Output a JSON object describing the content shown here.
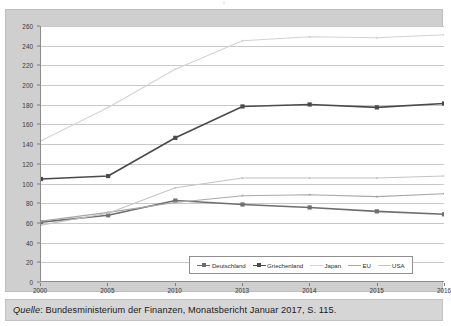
{
  "caption": {
    "source_label": "Quelle",
    "source_text": ": Bundesministerium der Finanzen, Monatsbericht Januar 2017, S. 115."
  },
  "chart_data": {
    "type": "line",
    "title": "",
    "xlabel": "",
    "ylabel": "Staatsschuldenquoten in %",
    "categories": [
      "2000",
      "2005",
      "2010",
      "2013",
      "2014",
      "2015",
      "2016"
    ],
    "ylim": [
      0,
      260
    ],
    "ytick_step": 20,
    "yticks": [
      0,
      20,
      40,
      60,
      80,
      100,
      120,
      140,
      160,
      180,
      200,
      220,
      240,
      260
    ],
    "grid": true,
    "legend_position": "bottom-center",
    "series": [
      {
        "name": "Deutschland",
        "color": "#6e6e6e",
        "marker": "square",
        "values": [
          60,
          67,
          82,
          78,
          75,
          71,
          68
        ]
      },
      {
        "name": "Griechenland",
        "color": "#4a4a4a",
        "marker": "square",
        "values": [
          104,
          107,
          146,
          178,
          180,
          177,
          181
        ]
      },
      {
        "name": "Japan",
        "color": "#d2d2d2",
        "marker": "none",
        "values": [
          143,
          177,
          216,
          245,
          249,
          248,
          251
        ]
      },
      {
        "name": "EU",
        "color": "#a8a8a8",
        "marker": "none",
        "values": [
          61,
          70,
          80,
          87,
          88,
          86,
          89
        ]
      },
      {
        "name": "USA",
        "color": "#c4c4c4",
        "marker": "none",
        "values": [
          57,
          69,
          95,
          105,
          105,
          105,
          107
        ]
      }
    ]
  }
}
